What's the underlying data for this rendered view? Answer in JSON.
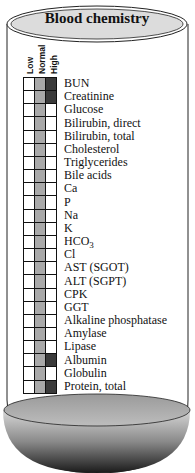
{
  "title": "Blood chemistry",
  "columns": [
    "Low",
    "Normal",
    "High"
  ],
  "colors": {
    "low": "#ffffff",
    "normal": "#a8a8a8",
    "high": "#3a3a3a",
    "outline": "#111111",
    "title_fill": "#dcdcdc"
  },
  "rows": [
    {
      "label": "BUN",
      "level": "High"
    },
    {
      "label": "Creatinine",
      "level": "High"
    },
    {
      "label": "Glucose",
      "level": "Normal"
    },
    {
      "label": "Bilirubin, direct",
      "level": "Normal"
    },
    {
      "label": "Bilirubin, total",
      "level": "Normal"
    },
    {
      "label": "Cholesterol",
      "level": "Normal"
    },
    {
      "label": "Triglycerides",
      "level": "Normal"
    },
    {
      "label": "Bile acids",
      "level": "Normal"
    },
    {
      "label": "Ca",
      "level": "Normal"
    },
    {
      "label": "P",
      "level": "Normal"
    },
    {
      "label": "Na",
      "level": "Normal"
    },
    {
      "label": "K",
      "level": "Normal"
    },
    {
      "label": "HCO3",
      "level": "Normal"
    },
    {
      "label": "Cl",
      "level": "Normal"
    },
    {
      "label": "AST (SGOT)",
      "level": "Normal"
    },
    {
      "label": "ALT (SGPT)",
      "level": "Normal"
    },
    {
      "label": "CPK",
      "level": "Normal"
    },
    {
      "label": "GGT",
      "level": "Normal"
    },
    {
      "label": "Alkaline phosphatase",
      "level": "Normal"
    },
    {
      "label": "Amylase",
      "level": "Normal"
    },
    {
      "label": "Lipase",
      "level": "Normal"
    },
    {
      "label": "Albumin",
      "level": "High"
    },
    {
      "label": "Globulin",
      "level": "Normal"
    },
    {
      "label": "Protein, total",
      "level": "High"
    }
  ]
}
